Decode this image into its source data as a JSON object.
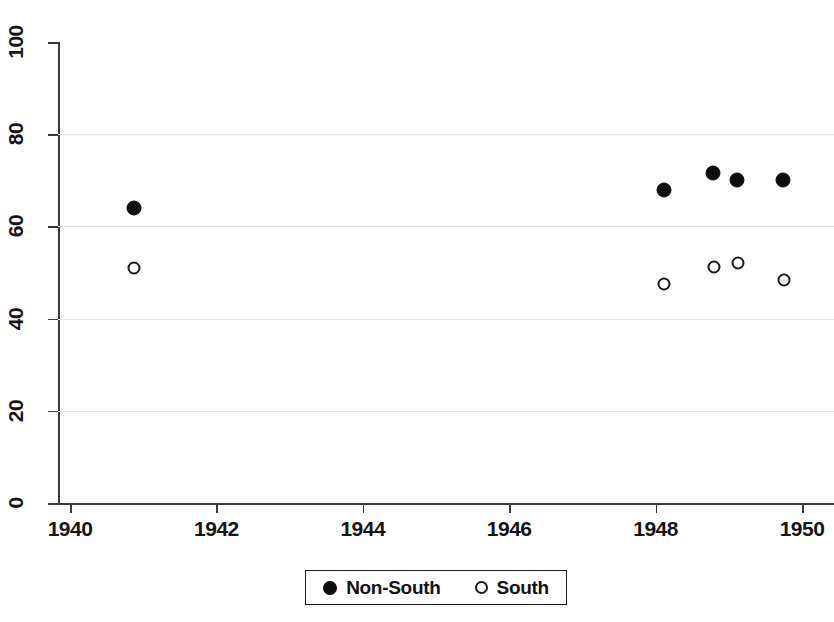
{
  "chart_data": {
    "type": "scatter",
    "title": "",
    "subtitle": "",
    "xlabel": "",
    "ylabel": "",
    "xlim": [
      1939.6,
      1950.6
    ],
    "ylim": [
      0,
      100
    ],
    "xticks": [
      1940,
      1942,
      1944,
      1946,
      1948,
      1950
    ],
    "xtick_labels": [
      "1940",
      "1942",
      "1944",
      "1946",
      "1948",
      "1950"
    ],
    "yticks": [
      0,
      20,
      40,
      60,
      80,
      100
    ],
    "ytick_labels": [
      "0",
      "20",
      "40",
      "60",
      "80",
      "100"
    ],
    "grid": "horizontal",
    "gridlines_at": [
      20,
      40,
      60,
      80
    ],
    "legend_position": "bottom-center",
    "series": [
      {
        "name": "Non-South",
        "marker": "filled-circle",
        "color": "#0d0d0d",
        "x": [
          1940.87,
          1948.11,
          1948.78,
          1949.11,
          1949.74
        ],
        "y": [
          64,
          68,
          71.5,
          70,
          70
        ]
      },
      {
        "name": "South",
        "marker": "open-circle",
        "color": "#1a1a1a",
        "x": [
          1940.87,
          1948.11,
          1948.8,
          1949.12,
          1949.76
        ],
        "y": [
          51,
          47.5,
          51.3,
          52,
          48.3
        ]
      }
    ]
  },
  "legend": {
    "entries": [
      {
        "label": "Non-South",
        "marker": "filled-circle"
      },
      {
        "label": "South",
        "marker": "open-circle"
      }
    ]
  },
  "axes": {
    "y_tick_labels": [
      "100",
      "80",
      "60",
      "40",
      "20",
      "0"
    ],
    "x_tick_labels": [
      "1940",
      "1942",
      "1944",
      "1946",
      "1948",
      "1950"
    ]
  }
}
